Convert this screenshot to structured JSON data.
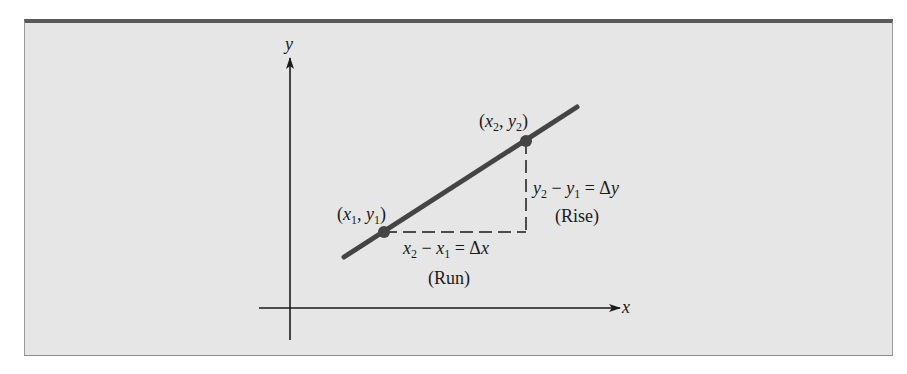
{
  "diagram": {
    "colors": {
      "background": "#e6e6e6",
      "border_top": "#5a5a5a",
      "axis": "#1a1a1a",
      "line": "#444444",
      "point": "#444444",
      "dashed": "#1a1a1a",
      "text": "#1a1a1a"
    },
    "axes": {
      "x_label": "x",
      "y_label": "y"
    },
    "points": [
      {
        "name": "point-1",
        "label": "(x1, y1)",
        "sub_x": "1",
        "sub_y": "1",
        "px": 384,
        "py": 232
      },
      {
        "name": "point-2",
        "label": "(x2, y2)",
        "sub_x": "2",
        "sub_y": "2",
        "px": 526,
        "py": 141
      }
    ],
    "line": {
      "x1": 344,
      "y1": 257,
      "x2": 577,
      "y2": 107
    },
    "run": {
      "equation": "x2 − x1 = Δx",
      "caption": "(Run)"
    },
    "rise": {
      "equation": "y2 − y1 = Δy",
      "caption": "(Rise)"
    },
    "text": {
      "x": "x",
      "y": "y",
      "open_paren": "(",
      "close_paren": ")",
      "comma": ", ",
      "minus": " − ",
      "equals": " = Δ",
      "sub1": "1",
      "sub2": "2",
      "run_caption": "(Run)",
      "rise_caption": "(Rise)"
    }
  }
}
